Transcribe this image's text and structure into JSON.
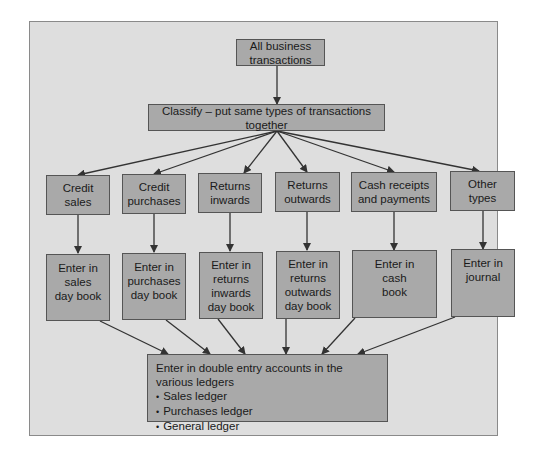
{
  "diagram": {
    "root": {
      "label": "All business transactions"
    },
    "classify": {
      "label": "Classify – put same types of transactions together"
    },
    "categories": [
      {
        "lines": [
          "Credit",
          "sales"
        ]
      },
      {
        "lines": [
          "Credit",
          "purchases"
        ]
      },
      {
        "lines": [
          "Returns",
          "inwards"
        ]
      },
      {
        "lines": [
          "Returns",
          "outwards"
        ]
      },
      {
        "lines": [
          "Cash receipts",
          "and payments"
        ]
      },
      {
        "lines": [
          "Other",
          "types"
        ]
      }
    ],
    "books": [
      {
        "lines": [
          "Enter in",
          "sales",
          "day book"
        ]
      },
      {
        "lines": [
          "Enter in",
          "purchases",
          "day book"
        ]
      },
      {
        "lines": [
          "Enter in",
          "returns",
          "inwards",
          "day book"
        ]
      },
      {
        "lines": [
          "Enter in",
          "returns",
          "outwards",
          "day book"
        ]
      },
      {
        "lines": [
          "Enter in",
          "cash",
          "book"
        ]
      },
      {
        "lines": [
          "Enter in",
          "journal"
        ]
      }
    ],
    "final": {
      "heading": "Enter in double entry accounts in the various ledgers",
      "bullets": [
        "Sales ledger",
        "Purchases ledger",
        "General ledger"
      ]
    },
    "colors": {
      "panel": "#dedede",
      "box": "#a9a9a9",
      "border": "#555555",
      "arrow": "#333333"
    }
  }
}
